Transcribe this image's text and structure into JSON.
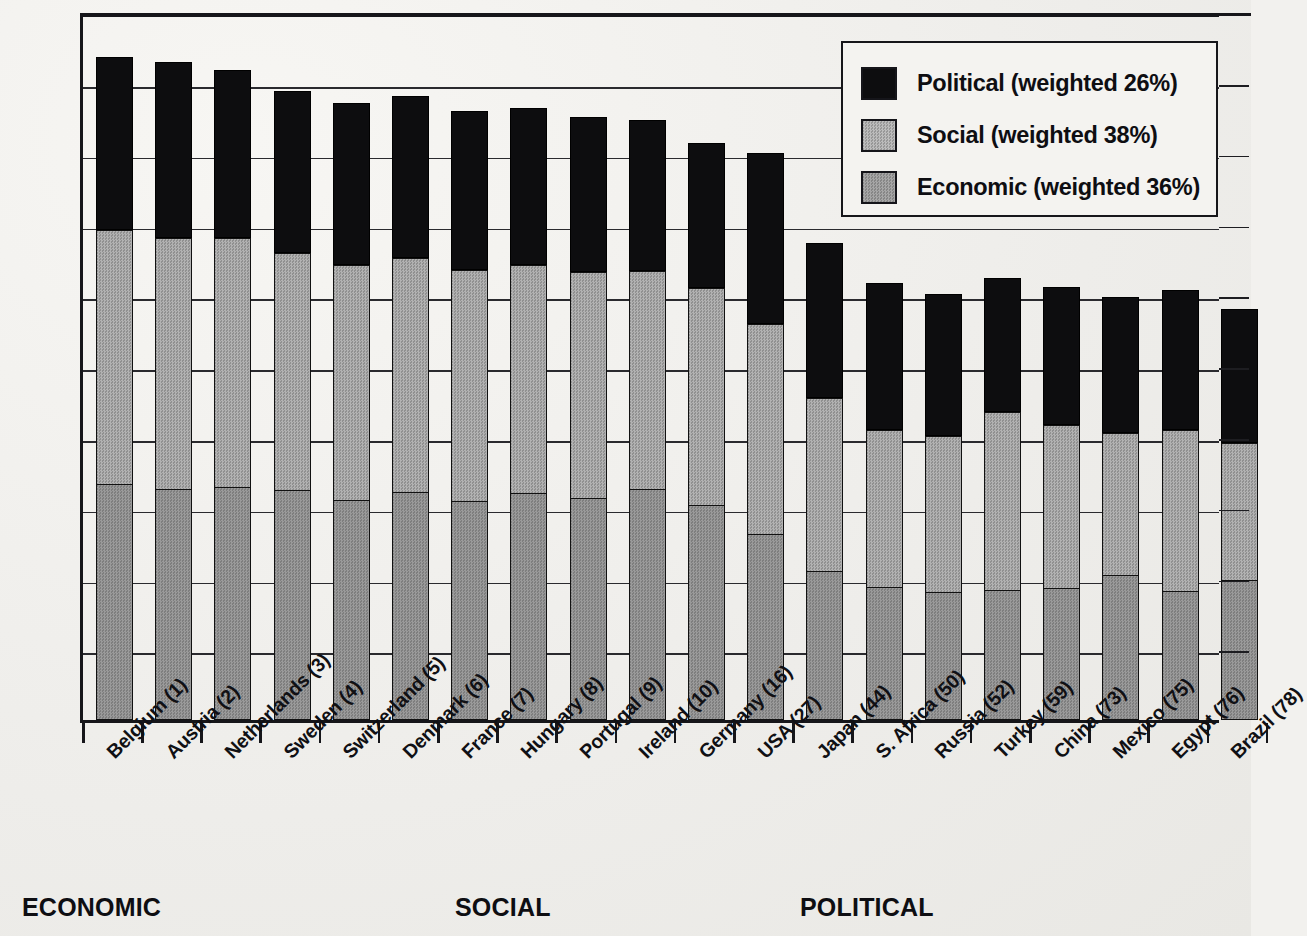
{
  "legend": {
    "items": [
      {
        "label": "Political (weighted 26%)",
        "key": "political",
        "color": "#0d0d0f",
        "swatch_name": "legend-swatch-political"
      },
      {
        "label": "Social (weighted 38%)",
        "key": "social",
        "color": "#a9a9a9",
        "swatch_name": "legend-swatch-social"
      },
      {
        "label": "Economic (weighted 36%)",
        "key": "economic",
        "color": "#969696",
        "swatch_name": "legend-swatch-economic"
      }
    ]
  },
  "footer": {
    "labels": [
      {
        "text": "ECONOMIC",
        "x": 22
      },
      {
        "text": "SOCIAL",
        "x": 455
      },
      {
        "text": "POLITICAL",
        "x": 800
      }
    ]
  },
  "chart_data": {
    "type": "bar",
    "subtype": "stacked-bar",
    "title": "",
    "xlabel": "",
    "ylabel": "",
    "grid": true,
    "legend_position": "top-right",
    "categories": [
      "Belgium (1)",
      "Austria (2)",
      "Netherlands (3)",
      "Sweden (4)",
      "Switzerland (5)",
      "Denmark (6)",
      "France (7)",
      "Hungary (8)",
      "Portugal (9)",
      "Ireland (10)",
      "Germany (16)",
      "USA (27)",
      "Japan (44)",
      "S. Africa (50)",
      "Russia (52)",
      "Turkey (59)",
      "China (73)",
      "Mexico (75)",
      "Egypt (76)",
      "Brazil (78)"
    ],
    "ylim": [
      0,
      100
    ],
    "y_gridline_values": [
      0,
      10,
      20,
      30,
      40,
      50,
      60,
      70,
      80,
      90,
      100
    ],
    "series": [
      {
        "name": "Economic (weighted 36%)",
        "key": "economic",
        "color": "#8d8d8d",
        "values": [
          33.2,
          32.5,
          32.7,
          32.4,
          31.0,
          32.1,
          30.8,
          31.9,
          31.2,
          32.5,
          30.2,
          26.2,
          20.9,
          18.7,
          18.0,
          18.2,
          18.5,
          20.4,
          18.1,
          19.7
        ]
      },
      {
        "name": "Social (weighted 38%)",
        "key": "social",
        "color": "#a0a0a0",
        "values": [
          36.0,
          35.6,
          35.4,
          33.5,
          33.3,
          33.1,
          32.7,
          32.4,
          32.1,
          30.9,
          30.8,
          29.8,
          24.6,
          22.3,
          22.1,
          25.3,
          23.1,
          20.1,
          22.8,
          19.4
        ]
      },
      {
        "name": "Political (weighted 26%)",
        "key": "political",
        "color": "#0d0d0f",
        "values": [
          24.5,
          24.8,
          23.7,
          23.0,
          22.8,
          22.9,
          22.5,
          22.2,
          21.9,
          21.4,
          20.5,
          24.1,
          21.9,
          20.7,
          20.1,
          18.9,
          19.6,
          19.2,
          19.8,
          19.0
        ]
      }
    ],
    "bars": [
      {
        "category": "Belgium (1)",
        "economic": 33.2,
        "social": 36.0,
        "political": 24.5,
        "total": 93.7
      },
      {
        "category": "Austria (2)",
        "economic": 32.5,
        "social": 35.6,
        "political": 24.8,
        "total": 92.9
      },
      {
        "category": "Netherlands (3)",
        "economic": 32.7,
        "social": 35.4,
        "political": 23.7,
        "total": 91.8
      },
      {
        "category": "Sweden (4)",
        "economic": 32.4,
        "social": 33.5,
        "political": 23.0,
        "total": 88.9
      },
      {
        "category": "Switzerland (5)",
        "economic": 31.0,
        "social": 33.3,
        "political": 22.8,
        "total": 87.1
      },
      {
        "category": "Denmark (6)",
        "economic": 32.1,
        "social": 33.1,
        "political": 22.9,
        "total": 88.1
      },
      {
        "category": "France (7)",
        "economic": 30.8,
        "social": 32.7,
        "political": 22.5,
        "total": 86.0
      },
      {
        "category": "Hungary (8)",
        "economic": 31.9,
        "social": 32.4,
        "political": 22.2,
        "total": 86.5
      },
      {
        "category": "Portugal (9)",
        "economic": 31.2,
        "social": 32.1,
        "political": 21.9,
        "total": 85.2
      },
      {
        "category": "Ireland (10)",
        "economic": 32.5,
        "social": 30.9,
        "political": 21.4,
        "total": 84.8
      },
      {
        "category": "Germany (16)",
        "economic": 30.2,
        "social": 30.8,
        "political": 20.5,
        "total": 81.5
      },
      {
        "category": "USA (27)",
        "economic": 26.2,
        "social": 29.8,
        "political": 24.1,
        "total": 80.1
      },
      {
        "category": "Japan (44)",
        "economic": 20.9,
        "social": 24.6,
        "political": 21.9,
        "total": 67.4
      },
      {
        "category": "S. Africa (50)",
        "economic": 18.7,
        "social": 22.3,
        "political": 20.7,
        "total": 61.7
      },
      {
        "category": "Russia (52)",
        "economic": 18.0,
        "social": 22.1,
        "political": 20.1,
        "total": 60.2
      },
      {
        "category": "Turkey (59)",
        "economic": 18.2,
        "social": 25.3,
        "political": 18.9,
        "total": 62.4
      },
      {
        "category": "China (73)",
        "economic": 18.5,
        "social": 23.1,
        "political": 19.6,
        "total": 61.2
      },
      {
        "category": "Mexico (75)",
        "economic": 20.4,
        "social": 20.1,
        "political": 19.2,
        "total": 59.7
      },
      {
        "category": "Egypt (76)",
        "economic": 18.1,
        "social": 22.8,
        "political": 19.8,
        "total": 60.7
      },
      {
        "category": "Brazil (78)",
        "economic": 19.7,
        "social": 19.4,
        "political": 19.0,
        "total": 58.1
      }
    ]
  },
  "geometry": {
    "plot_left": 80,
    "plot_top": 15,
    "plot_right": 1219,
    "plot_bottom": 723,
    "bar_width": 37,
    "bar_pitch": 59.2,
    "first_bar_left": 93,
    "px_per_unit": 7.08
  }
}
